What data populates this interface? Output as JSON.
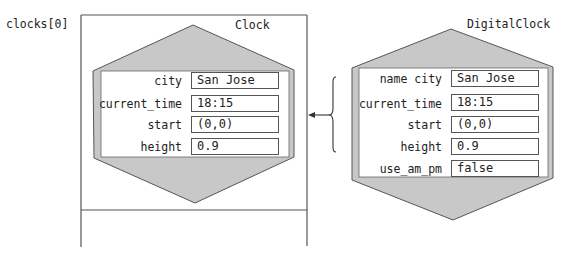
{
  "variable_label": "clocks[0]",
  "left_object": {
    "class_name": "Clock",
    "fields": [
      {
        "name": "city",
        "value": "San Jose"
      },
      {
        "name": "current_time",
        "value": "18:15"
      },
      {
        "name": "start",
        "value": "(0,0)"
      },
      {
        "name": "height",
        "value": "0.9"
      }
    ]
  },
  "right_object": {
    "class_name": "DigitalClock",
    "fields": [
      {
        "name": "name city",
        "value": "San Jose"
      },
      {
        "name": "current_time",
        "value": "18:15"
      },
      {
        "name": "start",
        "value": "(0,0)"
      },
      {
        "name": "height",
        "value": "0.9"
      },
      {
        "name": "use_am_pm",
        "value": "false"
      }
    ]
  },
  "colors": {
    "hexagon_fill": "#c8c8c8",
    "stroke": "#555555",
    "panel": "#ffffff"
  }
}
